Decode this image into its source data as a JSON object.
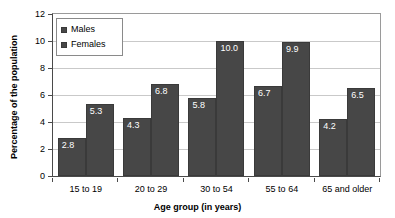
{
  "chart_data": {
    "type": "bar",
    "title": "",
    "xlabel": "Age group (in years)",
    "ylabel": "Percentage of the population",
    "categories": [
      "15 to 19",
      "20 to 29",
      "30 to 54",
      "55 to 64",
      "65 and older"
    ],
    "series": [
      {
        "name": "Males",
        "values": [
          2.8,
          4.3,
          5.8,
          6.7,
          4.2
        ]
      },
      {
        "name": "Females",
        "values": [
          5.3,
          6.8,
          10.0,
          9.9,
          6.5
        ]
      }
    ],
    "ylim": [
      0,
      12
    ],
    "yticks": [
      "0",
      "2",
      "4",
      "6",
      "8",
      "10",
      "12"
    ],
    "ytick_values": [
      0,
      2,
      4,
      6,
      8,
      10,
      12
    ],
    "bar_labels": [
      "2.8",
      "5.3",
      "4.3",
      "6.8",
      "5.8",
      "10.0",
      "6.7",
      "9.9",
      "4.2",
      "6.5"
    ],
    "grid": true,
    "legend_position": "top-left",
    "colors": {
      "bar_fill": "#474747",
      "bar_stroke": "#3a3a3a",
      "gridline": "#c9c9c9",
      "axis": "#4a4a4a",
      "label_text": "#ffffff",
      "background": "#ffffff"
    }
  },
  "legend": {
    "items": [
      {
        "label": "Males"
      },
      {
        "label": "Females"
      }
    ]
  }
}
